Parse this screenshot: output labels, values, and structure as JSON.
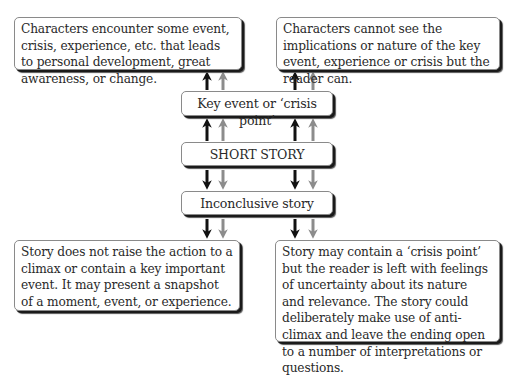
{
  "diagram": {
    "top_left": "Characters encounter some event, crisis, experience, etc. that leads to personal development, great awareness, or change.",
    "top_right": "Characters cannot see the implications or nature of the key event, experience or crisis but the reader can.",
    "key_event": "Key event or ‘crisis point’",
    "center": "SHORT STORY",
    "inconclusive": "Inconclusive story",
    "bottom_left": "Story does not raise the action to a climax or contain a key important event. It may present a snapshot of a moment, event, or experience.",
    "bottom_right": "Story may contain a ‘crisis point’ but the reader is left with feelings of uncertainty about its nature and relevance. The story could deliberately make use of anti-climax and leave the ending open to a number of interpretations or questions.",
    "colors": {
      "arrow_dark": "#111111",
      "arrow_gray": "#8c8c8c",
      "box_border": "#8a8a8a",
      "box_shadow": "#1a1a1a"
    }
  }
}
